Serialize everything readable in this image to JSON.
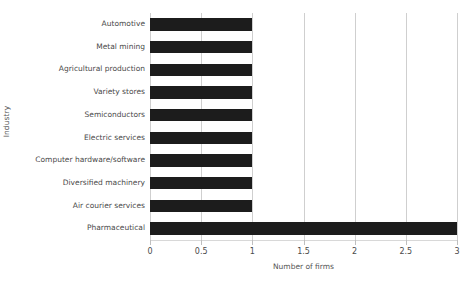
{
  "chart_data": {
    "type": "bar",
    "orientation": "horizontal",
    "title": "",
    "xlabel": "Number of firms",
    "ylabel": "Industry",
    "categories": [
      "Automotive",
      "Metal mining",
      "Agricultural production",
      "Variety stores",
      "Semiconductors",
      "Electric services",
      "Computer hardware/software",
      "Diversified machinery",
      "Air courier services",
      "Pharmaceutical"
    ],
    "values": [
      1,
      1,
      1,
      1,
      1,
      1,
      1,
      1,
      1,
      3
    ],
    "xlim": [
      0,
      3
    ],
    "xticks": [
      0,
      0.5,
      1,
      1.5,
      2,
      2.5,
      3
    ],
    "xtick_labels": [
      "0",
      "0.5",
      "1",
      "1.5",
      "2",
      "2.5",
      "3"
    ],
    "grid": "vertical",
    "legend": "none",
    "bar_color": "#1c1c1c",
    "gridline_color": "#cfcfcf",
    "axis_color": "#d8d8d8",
    "text_color": "#4a4a4a"
  }
}
